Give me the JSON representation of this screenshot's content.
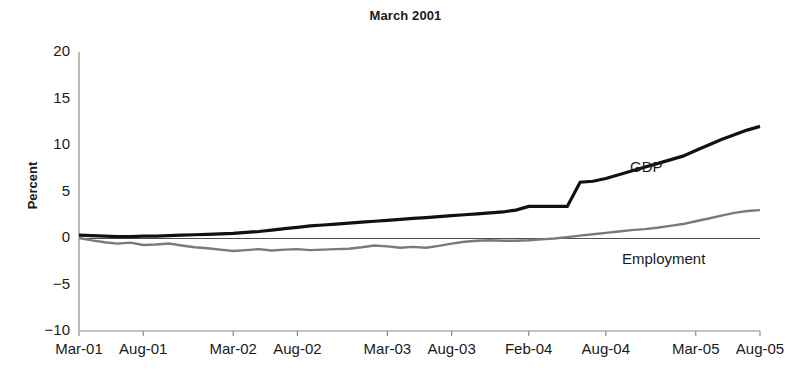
{
  "chart_data": {
    "type": "line",
    "title": "March 2001",
    "xlabel": "",
    "ylabel": "Percent",
    "ylim": [
      -10,
      20
    ],
    "yticks": [
      20,
      15,
      10,
      5,
      0,
      -5,
      -10
    ],
    "ytick_labels": [
      "20",
      "15",
      "10",
      "5",
      "0",
      "−5",
      "−10"
    ],
    "xtick_labels": [
      "Mar-01",
      "Aug-01",
      "Mar-02",
      "Aug-02",
      "Mar-03",
      "Aug-03",
      "Feb-04",
      "Aug-04",
      "Mar-05",
      "Aug-05"
    ],
    "grid": false,
    "legend_position": "inline-annotation",
    "zero_line": true,
    "annotations": [
      {
        "text": "GDP",
        "x_month": 44,
        "y_value": 7.6
      },
      {
        "text": "Employment",
        "x_month": 43,
        "y_value": -2.1
      }
    ],
    "x_months_from_mar01": [
      0,
      5,
      12,
      17,
      24,
      29,
      35,
      41,
      48,
      53
    ],
    "series": [
      {
        "name": "GDP",
        "color": "#111111",
        "width": 3.2,
        "x": [
          0,
          1,
          2,
          3,
          4,
          5,
          6,
          7,
          8,
          9,
          10,
          11,
          12,
          13,
          14,
          15,
          16,
          17,
          18,
          19,
          20,
          21,
          22,
          23,
          24,
          25,
          26,
          27,
          28,
          29,
          30,
          31,
          32,
          33,
          34,
          35,
          36,
          37,
          38,
          39,
          40,
          41,
          42,
          43,
          44,
          45,
          46,
          47,
          48,
          49,
          50,
          51,
          52,
          53
        ],
        "values": [
          0.3,
          0.25,
          0.2,
          0.15,
          0.15,
          0.2,
          0.2,
          0.25,
          0.3,
          0.35,
          0.4,
          0.45,
          0.5,
          0.6,
          0.7,
          0.85,
          1.0,
          1.15,
          1.3,
          1.4,
          1.5,
          1.6,
          1.7,
          1.8,
          1.9,
          2.0,
          2.1,
          2.2,
          2.3,
          2.4,
          2.5,
          2.6,
          2.7,
          2.8,
          3.0,
          3.4,
          3.4,
          3.4,
          3.4,
          6.0,
          6.1,
          6.4,
          6.8,
          7.2,
          7.6,
          8.0,
          8.4,
          8.8,
          9.4,
          10.0,
          10.6,
          11.1,
          11.6,
          12.0
        ]
      },
      {
        "name": "Employment",
        "color": "#7a7a7a",
        "width": 2.4,
        "x": [
          0,
          1,
          2,
          3,
          4,
          5,
          6,
          7,
          8,
          9,
          10,
          11,
          12,
          13,
          14,
          15,
          16,
          17,
          18,
          19,
          20,
          21,
          22,
          23,
          24,
          25,
          26,
          27,
          28,
          29,
          30,
          31,
          32,
          33,
          34,
          35,
          36,
          37,
          38,
          39,
          40,
          41,
          42,
          43,
          44,
          45,
          46,
          47,
          48,
          49,
          50,
          51,
          52,
          53
        ],
        "values": [
          0.0,
          -0.25,
          -0.45,
          -0.6,
          -0.5,
          -0.75,
          -0.7,
          -0.6,
          -0.8,
          -1.0,
          -1.1,
          -1.25,
          -1.4,
          -1.3,
          -1.2,
          -1.35,
          -1.25,
          -1.2,
          -1.3,
          -1.25,
          -1.2,
          -1.15,
          -1.0,
          -0.8,
          -0.9,
          -1.05,
          -0.95,
          -1.05,
          -0.85,
          -0.6,
          -0.4,
          -0.3,
          -0.25,
          -0.3,
          -0.3,
          -0.25,
          -0.15,
          -0.05,
          0.1,
          0.25,
          0.4,
          0.55,
          0.7,
          0.85,
          0.95,
          1.1,
          1.3,
          1.5,
          1.8,
          2.1,
          2.4,
          2.7,
          2.9,
          3.0
        ]
      }
    ]
  }
}
